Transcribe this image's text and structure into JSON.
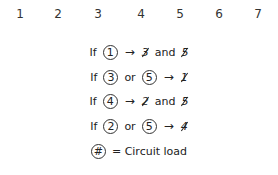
{
  "columns": [
    "1",
    "2",
    "3",
    "4",
    "5",
    "6",
    "7"
  ],
  "rules": [
    {
      "if": "If",
      "conds": [
        "1"
      ],
      "joiner": "",
      "arrow": "→",
      "results": [
        "3",
        "5"
      ],
      "result_joiner": "and"
    },
    {
      "if": "If",
      "conds": [
        "3",
        "5"
      ],
      "joiner": "or",
      "arrow": "→",
      "results": [
        "1"
      ],
      "result_joiner": ""
    },
    {
      "if": "If",
      "conds": [
        "4"
      ],
      "joiner": "",
      "arrow": "→",
      "results": [
        "2",
        "5"
      ],
      "result_joiner": "and"
    },
    {
      "if": "If",
      "conds": [
        "2",
        "5"
      ],
      "joiner": "or",
      "arrow": "→",
      "results": [
        "4"
      ],
      "result_joiner": ""
    }
  ],
  "legend": {
    "symbol": "#",
    "text": "= Circuit load"
  }
}
